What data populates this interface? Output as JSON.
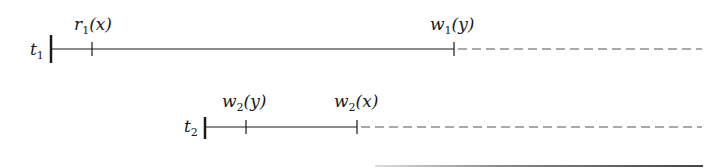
{
  "diagram": {
    "type": "transaction-timeline",
    "transactions": [
      {
        "name": "t",
        "index": "1",
        "operations": [
          {
            "op": "r",
            "index": "1",
            "arg": "(x)"
          },
          {
            "op": "w",
            "index": "1",
            "arg": "(y)"
          }
        ]
      },
      {
        "name": "t",
        "index": "2",
        "operations": [
          {
            "op": "w",
            "index": "2",
            "arg": "(y)"
          },
          {
            "op": "w",
            "index": "2",
            "arg": "(x)"
          }
        ]
      }
    ],
    "line_color": "#1a1a1a",
    "dash_color": "#555555"
  }
}
